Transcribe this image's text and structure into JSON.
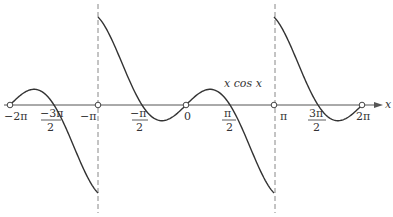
{
  "chart_data": {
    "type": "line",
    "title": "",
    "function_label": "x cos x",
    "xlabel": "x",
    "ylabel": "",
    "xlim": [
      -6.2832,
      6.2832
    ],
    "ylim": [
      -3.1416,
      3.1416
    ],
    "x_ticks": [
      "-2π",
      "-3π/2",
      "-π",
      "-π/2",
      "0",
      "π/2",
      "π",
      "3π/2",
      "2π"
    ],
    "x_tick_values": [
      -6.2832,
      -4.7124,
      -3.1416,
      -1.5708,
      0,
      1.5708,
      3.1416,
      4.7124,
      6.2832
    ],
    "discontinuities": [
      -3.1416,
      3.1416
    ],
    "open_points": [
      [
        -6.2832,
        0
      ],
      [
        -3.1416,
        0
      ],
      [
        0,
        0
      ],
      [
        3.1416,
        0
      ],
      [
        6.2832,
        0
      ]
    ],
    "grid": false,
    "legend": null
  },
  "labels": {
    "x_axis": "x",
    "func": "x cos x",
    "ticks": {
      "m2pi": "−2π",
      "mpi": "−π",
      "zero": "0",
      "pi": "π",
      "p2pi": "2π",
      "m3pi2_num": "−3π",
      "mpi2_num": "−π",
      "pi2_num": "π",
      "p3pi2_num": "3π",
      "den": "2"
    }
  },
  "colors": {
    "curve": "#333333",
    "axis": "#555555",
    "dashed": "#888888"
  }
}
